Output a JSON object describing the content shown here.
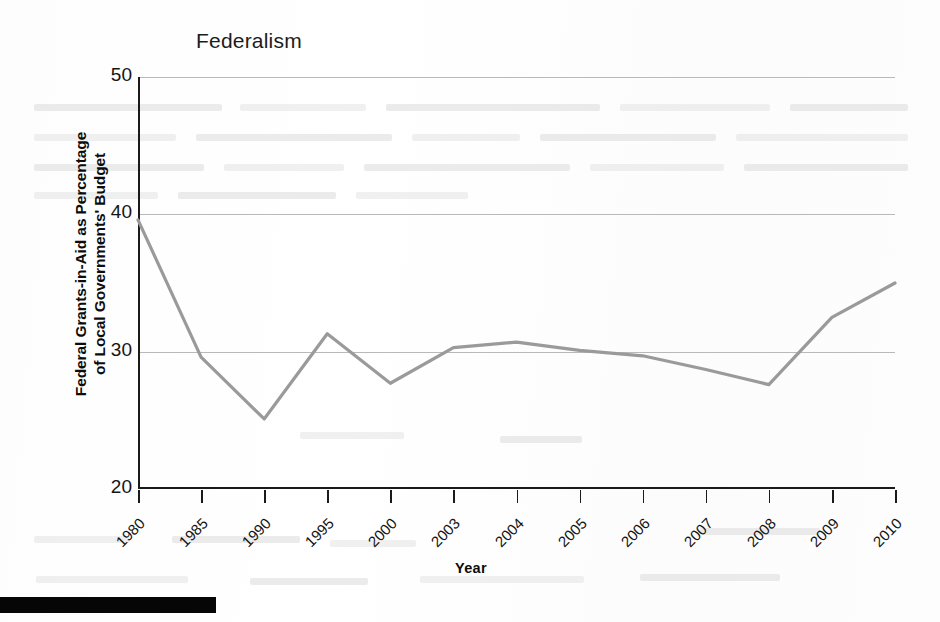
{
  "figure": {
    "title": "Federalism",
    "x_axis_title": "Year",
    "y_axis_title_line1": "Federal Grants-in-Aid as Percentage",
    "y_axis_title_line2": "of Local Governments' Budget",
    "line_color": "#9a9a9a",
    "axis_color": "#1a1a1a",
    "grid_color": "#b9b9b9"
  },
  "chart_data": {
    "type": "line",
    "title": "Federalism",
    "xlabel": "Year",
    "ylabel": "Federal Grants-in-Aid as Percentage of Local Governments' Budget",
    "categories": [
      "1980",
      "1985",
      "1990",
      "1995",
      "2000",
      "2003",
      "2004",
      "2005",
      "2006",
      "2007",
      "2008",
      "2009",
      "2010"
    ],
    "values": [
      39.6,
      29.6,
      25.1,
      31.3,
      27.7,
      30.3,
      30.7,
      30.1,
      29.7,
      28.7,
      27.6,
      32.5,
      35.0
    ],
    "ylim": [
      20,
      50
    ],
    "yticks": [
      20,
      30,
      40,
      50
    ],
    "ytick_labels": [
      "20",
      "30",
      "40",
      "50"
    ],
    "grid": "horizontal",
    "legend": "none",
    "series_count": 1
  }
}
